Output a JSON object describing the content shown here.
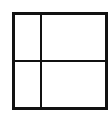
{
  "diagram": {
    "type": "grid",
    "rows": 2,
    "columns": 2,
    "line_color": "#111111",
    "background_color": "#ffffff",
    "cells": [
      {
        "row": 0,
        "col": 0,
        "label": ""
      },
      {
        "row": 0,
        "col": 1,
        "label": ""
      },
      {
        "row": 1,
        "col": 0,
        "label": ""
      },
      {
        "row": 1,
        "col": 1,
        "label": ""
      }
    ]
  }
}
